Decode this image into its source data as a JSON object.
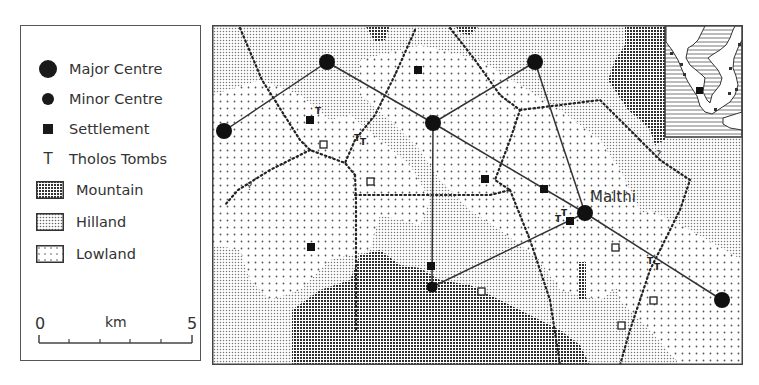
{
  "legend": {
    "items": [
      {
        "symbol": "major-centre-icon",
        "label": "Major Centre"
      },
      {
        "symbol": "minor-centre-icon",
        "label": "Minor Centre"
      },
      {
        "symbol": "settlement-icon",
        "label": "Settlement"
      },
      {
        "symbol": "tholos-tomb-icon",
        "glyph": "T",
        "label": "Tholos Tombs"
      },
      {
        "symbol": "mountain-swatch",
        "label": "Mountain"
      },
      {
        "symbol": "hilland-swatch",
        "label": "Hilland"
      },
      {
        "symbol": "lowland-swatch",
        "label": "Lowland"
      }
    ],
    "scale": {
      "start": "0",
      "unit": "km",
      "end": "5"
    }
  },
  "map": {
    "labels": {
      "malthi": "Malthi"
    },
    "uncertain_marker": "?",
    "colors": {
      "ink": "#1a1a1a",
      "paper": "#ffffff",
      "mountain": "#3a3a3a",
      "hilland": "#9a9a9a",
      "lowland": "#b8b8b8"
    }
  }
}
